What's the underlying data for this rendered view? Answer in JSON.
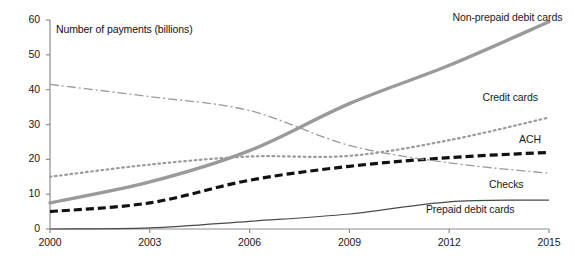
{
  "chart_data": {
    "type": "line",
    "title": "",
    "xlabel": "",
    "ylabel": "Number of payments (billions)",
    "axis_title": "Number of payments (billions)",
    "x": [
      2000,
      2003,
      2006,
      2009,
      2012,
      2015
    ],
    "xlim": [
      2000,
      2015
    ],
    "ylim": [
      0,
      60
    ],
    "yticks": [
      "0",
      "10",
      "20",
      "30",
      "40",
      "50",
      "60"
    ],
    "xticks": [
      "2000",
      "2003",
      "2006",
      "2009",
      "2012",
      "2015"
    ],
    "grid": false,
    "legend_position": "right-inline-labels",
    "series": [
      {
        "name": "Non-prepaid debit cards",
        "style": "solid-thick",
        "color": "#9a9a9a",
        "label_x": 2012.1,
        "label_y": 60.5,
        "values": [
          7.5,
          13.5,
          22.5,
          36.0,
          47.0,
          59.5
        ]
      },
      {
        "name": "Credit cards",
        "style": "dotted",
        "color": "#9a9a9a",
        "label_x": 2013.0,
        "label_y": 37.5,
        "values": [
          15.0,
          18.5,
          20.8,
          21.0,
          25.5,
          32.0
        ]
      },
      {
        "name": "ACH",
        "style": "dashed",
        "color": "#111111",
        "label_x": 2014.1,
        "label_y": 25.5,
        "values": [
          5.0,
          7.5,
          14.0,
          18.0,
          20.5,
          22.0
        ]
      },
      {
        "name": "Checks",
        "style": "dash-dot",
        "color": "#9a9a9a",
        "label_x": 2013.2,
        "label_y": 12.6,
        "values": [
          41.5,
          38.0,
          34.0,
          24.0,
          19.0,
          16.0
        ]
      },
      {
        "name": "Prepaid debit cards",
        "style": "solid-thin",
        "color": "#4a4a4a",
        "label_x": 2011.3,
        "label_y": 5.4,
        "values": [
          0.0,
          0.3,
          2.2,
          4.3,
          7.8,
          8.3
        ]
      }
    ]
  }
}
